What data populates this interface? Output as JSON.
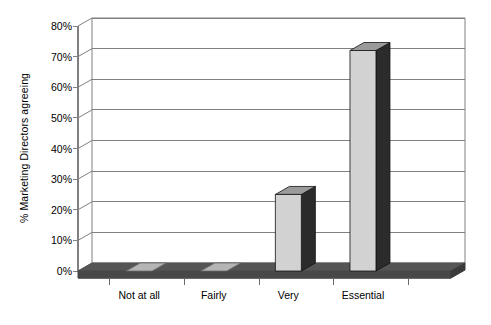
{
  "chart_data": {
    "type": "bar",
    "title": "",
    "subtitle": "",
    "xlabel": "",
    "ylabel": "% Marketing Directors agreeing",
    "categories": [
      "Not at all",
      "Fairly",
      "Very",
      "Essential"
    ],
    "values": [
      0,
      0,
      25,
      72
    ],
    "ylim": [
      0,
      80
    ],
    "ytick_labels": [
      "0%",
      "10%",
      "20%",
      "30%",
      "40%",
      "50%",
      "60%",
      "70%",
      "80%"
    ],
    "ytick_values": [
      0,
      10,
      20,
      30,
      40,
      50,
      60,
      70,
      80
    ],
    "grid": true,
    "grid_axis": "y",
    "legend": false,
    "legend_position": "none",
    "style": "3d-column",
    "series": [
      {
        "name": "% Marketing Directors agreeing",
        "values": [
          0,
          0,
          25,
          72
        ]
      }
    ],
    "colors": {
      "bar_front": "#d2d2d2",
      "bar_side": "#2b2b2b",
      "bar_top": "#9a9a9a",
      "floor": "#555555",
      "floor_light": "#b5b5b5",
      "gridline": "#808080",
      "axis": "#808080",
      "text": "#000000",
      "background": "#ffffff"
    }
  },
  "axis": {
    "y_title": "% Marketing Directors agreeing"
  }
}
